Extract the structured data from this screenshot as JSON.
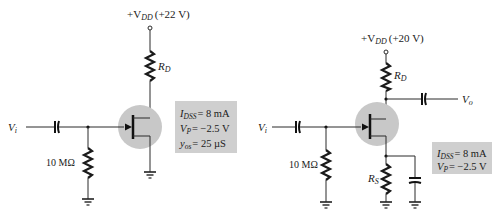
{
  "circuits": [
    {
      "id": "left",
      "supply": {
        "label_prefix": "+V",
        "label_sub": "DD",
        "value": "(+22 V)"
      },
      "drain_resistor": {
        "label": "R",
        "sub": "D"
      },
      "input": {
        "label": "V",
        "sub": "i"
      },
      "gate_resistor": {
        "value": "10 MΩ"
      },
      "parameters": [
        {
          "sym": "I",
          "sub": "DSS",
          "value": "= 8 mA"
        },
        {
          "sym": "V",
          "sub": "P",
          "value": "= −2.5 V"
        },
        {
          "sym": "y",
          "sub": "os",
          "value": "= 25 µS"
        }
      ]
    },
    {
      "id": "right",
      "supply": {
        "label_prefix": "+V",
        "label_sub": "DD",
        "value": "(+20 V)"
      },
      "drain_resistor": {
        "label": "R",
        "sub": "D"
      },
      "source_resistor": {
        "label": "R",
        "sub": "S"
      },
      "input": {
        "label": "V",
        "sub": "i"
      },
      "output": {
        "label": "V",
        "sub": "o"
      },
      "gate_resistor": {
        "value": "10 MΩ"
      },
      "parameters": [
        {
          "sym": "I",
          "sub": "DSS",
          "value": "= 8 mA"
        },
        {
          "sym": "V",
          "sub": "P",
          "value": "= −2.5 V"
        }
      ]
    }
  ],
  "colors": {
    "highlight": "#c8c8c8",
    "param_box": "#cfcfcf",
    "line": "#1a1a1a"
  }
}
